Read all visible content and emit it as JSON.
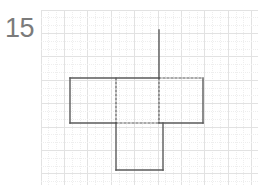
{
  "problem": {
    "number": "15",
    "number_color": "#7b7b7b"
  },
  "grid": {
    "label": "graph-paper",
    "origin_x": 41,
    "origin_y": 10,
    "width": 217,
    "height": 175,
    "minor_spacing": 7.8,
    "major_spacing": 23.4,
    "minor_color": "#eeeeee",
    "major_color": "#e2e2e2",
    "minor_dash": "1,1",
    "background": "#ffffff"
  },
  "figure": {
    "name": "net-of-a-solid",
    "stroke_color": "#5a5a5a",
    "stroke_width": 1.4,
    "dashed_color": "#555555",
    "dash_pattern": "2,2",
    "unit": 46.5,
    "solid_segments": [
      {
        "name": "upper-flap-stem",
        "x1": 159,
        "y1": 30,
        "x2": 159,
        "y2": 78
      },
      {
        "name": "middle-band-top-left",
        "x1": 70,
        "y1": 78,
        "x2": 159,
        "y2": 78
      },
      {
        "name": "middle-band-left",
        "x1": 70,
        "y1": 78,
        "x2": 70,
        "y2": 123
      },
      {
        "name": "middle-band-bottom-left",
        "x1": 70,
        "y1": 123,
        "x2": 116,
        "y2": 123
      },
      {
        "name": "right-panel-right",
        "x1": 203,
        "y1": 78,
        "x2": 203,
        "y2": 123
      },
      {
        "name": "right-panel-bottom",
        "x1": 159,
        "y1": 123,
        "x2": 203,
        "y2": 123
      },
      {
        "name": "bottom-panel-left",
        "x1": 116,
        "y1": 123,
        "x2": 116,
        "y2": 170
      },
      {
        "name": "bottom-panel-bottom",
        "x1": 116,
        "y1": 170,
        "x2": 163,
        "y2": 170
      },
      {
        "name": "bottom-panel-right",
        "x1": 163,
        "y1": 170,
        "x2": 163,
        "y2": 123
      }
    ],
    "dashed_segments": [
      {
        "name": "fold-top-right",
        "x1": 159,
        "y1": 78,
        "x2": 203,
        "y2": 78
      },
      {
        "name": "fold-vertical-left",
        "x1": 116,
        "y1": 78,
        "x2": 116,
        "y2": 123
      },
      {
        "name": "fold-vertical-right",
        "x1": 159,
        "y1": 78,
        "x2": 159,
        "y2": 123
      },
      {
        "name": "fold-horizontal-bottom",
        "x1": 116,
        "y1": 123,
        "x2": 159,
        "y2": 123
      }
    ]
  }
}
